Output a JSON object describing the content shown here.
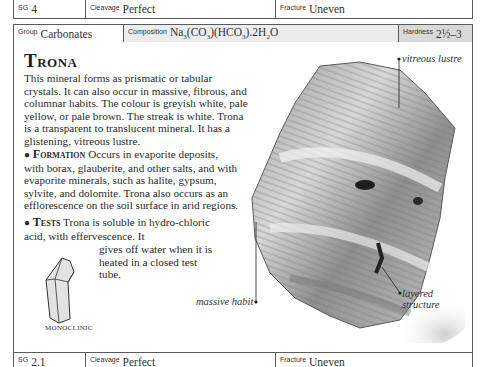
{
  "top_strip": {
    "sg": {
      "label": "SG",
      "value": "4"
    },
    "cleavage": {
      "label": "Cleavage",
      "value": "Perfect"
    },
    "fracture": {
      "label": "Fracture",
      "value": "Uneven"
    }
  },
  "header": {
    "group": {
      "label": "Group",
      "value": "Carbonates"
    },
    "composition": {
      "label": "Composition",
      "value": "Na3(CO3)(HCO3).2H2O"
    },
    "hardness": {
      "label": "Hardness",
      "value": "2½–3"
    }
  },
  "mineral": {
    "name": "Trona",
    "intro": "This mineral forms as prismatic or tabular crystals. It can also occur in massive, fibrous, and columnar habits. The colour is greyish white, pale yellow, or pale brown. The streak is white. Trona is a transparent to translucent mineral. It has a glistening, vitreous lustre.",
    "formation_heading": "Formation",
    "formation_text": "Occurs in evaporite deposits, with borax, glauberite, and other salts, and with evaporite minerals, such as halite, gypsum, sylvite, and dolomite. Trona also occurs as an efflorescence on the soil surface in arid regions.",
    "tests_heading": "Tests",
    "tests_text": "Trona is soluble in hydro-chloric acid, with effervescence. It",
    "tests_text_cont": "gives off water when it is heated in a closed test tube.",
    "crystal_system": "MONOCLINIC"
  },
  "photo_callouts": {
    "vitreous": "vitreous lustre",
    "massive": "massive habit",
    "layered_1": "layered",
    "layered_2": "structure"
  },
  "bottom_strip": {
    "sg": {
      "label": "SG",
      "value": "2.1"
    },
    "cleavage": {
      "label": "Cleavage",
      "value": "Perfect"
    },
    "fracture": {
      "label": "Fracture",
      "value": "Uneven"
    }
  }
}
